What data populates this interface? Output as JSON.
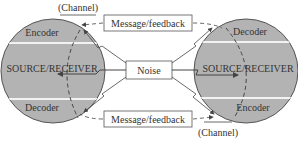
{
  "diagram": {
    "colors": {
      "circle_fill": "#b3b3b3",
      "circle_stroke": "#555555",
      "band": "#f2f2f2",
      "line": "#444444",
      "text": "#333333",
      "box_fill": "#ffffff"
    },
    "left_party": {
      "top_label": "Encoder",
      "center_label": "SOURCE/RECEIVER",
      "bottom_label": "Decoder"
    },
    "right_party": {
      "top_label": "Decoder",
      "center_label": "SOURCE/RECEIVER",
      "bottom_label": "Encoder"
    },
    "top_channel": {
      "box_label": "Message/feedback",
      "channel_label": "(Channel)"
    },
    "bottom_channel": {
      "box_label": "Message/feedback",
      "channel_label": "(Channel)"
    },
    "noise": {
      "label": "Noise"
    }
  }
}
